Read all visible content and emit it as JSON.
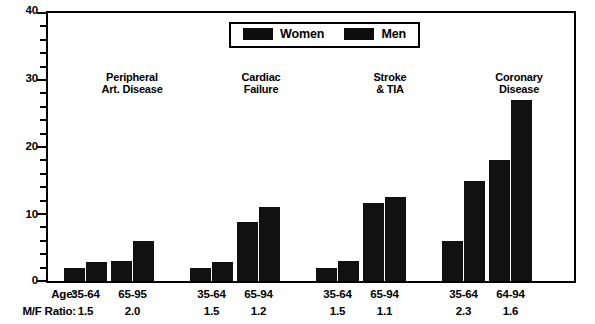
{
  "chart_data": {
    "type": "bar",
    "title": "",
    "subtitle": "",
    "xlabel": "",
    "ylabel": "",
    "ylim": [
      0,
      40
    ],
    "y_major_ticks": [
      0,
      10,
      20,
      30,
      40
    ],
    "y_minor_tick_interval": 2,
    "grid": false,
    "legend": {
      "position": "top-center",
      "entries": [
        {
          "name": "Women",
          "color": "#111111"
        },
        {
          "name": "Men",
          "color": "#111111"
        }
      ]
    },
    "groups": [
      {
        "title": "Peripheral\nArt. Disease",
        "subgroups": [
          {
            "age": "35-64",
            "mf_ratio": "1.5",
            "women": 2.0,
            "men": 2.9
          },
          {
            "age": "65-95",
            "mf_ratio": "2.0",
            "women": 3.0,
            "men": 6.0
          }
        ]
      },
      {
        "title": "Cardiac\nFailure",
        "subgroups": [
          {
            "age": "35-64",
            "mf_ratio": "1.5",
            "women": 2.0,
            "men": 2.9
          },
          {
            "age": "65-94",
            "mf_ratio": "1.2",
            "women": 8.8,
            "men": 11.0
          }
        ]
      },
      {
        "title": "Stroke\n& TIA",
        "subgroups": [
          {
            "age": "35-64",
            "mf_ratio": "1.5",
            "women": 2.0,
            "men": 3.0
          },
          {
            "age": "65-94",
            "mf_ratio": "1.1",
            "women": 11.7,
            "men": 12.5
          }
        ]
      },
      {
        "title": "Coronary\nDisease",
        "subgroups": [
          {
            "age": "35-64",
            "mf_ratio": "2.3",
            "women": 6.0,
            "men": 15.0
          },
          {
            "age": "64-94",
            "mf_ratio": "1.6",
            "women": 18.0,
            "men": 27.0
          }
        ]
      }
    ],
    "series": [
      {
        "name": "Women",
        "values": [
          2.0,
          3.0,
          2.0,
          8.8,
          2.0,
          11.7,
          6.0,
          18.0
        ]
      },
      {
        "name": "Men",
        "values": [
          2.9,
          6.0,
          2.9,
          11.0,
          3.0,
          12.5,
          15.0,
          27.0
        ]
      }
    ],
    "categories": [
      "Peripheral Art. Disease 35-64",
      "Peripheral Art. Disease 65-95",
      "Cardiac Failure 35-64",
      "Cardiac Failure 65-94",
      "Stroke & TIA 35-64",
      "Stroke & TIA 65-94",
      "Coronary Disease 35-64",
      "Coronary Disease 64-94"
    ]
  },
  "axis": {
    "y_labels": [
      "40",
      "30",
      "20",
      "10",
      "0"
    ]
  },
  "legend": {
    "women_label": "Women",
    "men_label": "Men"
  },
  "groups": {
    "g0_title": "Peripheral\nArt. Disease",
    "g1_title": "Cardiac\nFailure",
    "g2_title": "Stroke\n& TIA",
    "g3_title": "Coronary\nDisease"
  },
  "bottom": {
    "age_row_label": "Age:",
    "ratio_row_label": "M/F Ratio:",
    "ages": [
      "35-64",
      "65-95",
      "35-64",
      "65-94",
      "35-64",
      "65-94",
      "35-64",
      "64-94"
    ],
    "ratios": [
      "1.5",
      "2.0",
      "1.5",
      "1.2",
      "1.5",
      "1.1",
      "2.3",
      "1.6"
    ]
  }
}
